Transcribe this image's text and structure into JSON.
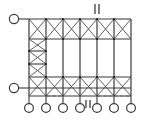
{
  "diagram": {
    "type": "structural-frame-elevation",
    "canvas": {
      "width": 160,
      "height": 123
    },
    "colors": {
      "line": "#3a3a3a",
      "line_light": "#6d6d6d",
      "background": "#ffffff",
      "node": "#1d1d1d"
    },
    "geometry": {
      "columns_x": [
        29,
        46,
        63,
        80,
        97,
        114,
        131
      ],
      "column_count": 7,
      "top_chord_y": 19,
      "top_band_bottom_y": 39,
      "bottom_band_top_y": 77,
      "bottom_chord_y": 96,
      "base_y": 96,
      "support_circle_y": 108,
      "left_pin_top_y": 19,
      "left_pin_bottom_y": 88,
      "left_pin_x": 14,
      "left_bay_strut_ys": [
        29,
        39,
        49,
        58,
        68,
        77
      ],
      "mid_rail_ys": [
        39,
        77
      ]
    },
    "bracing": {
      "top_band_panels": 6,
      "bottom_band_panels": 6,
      "left_bay_panels": 6,
      "pattern": "x-cross"
    },
    "supports": {
      "base_support_count": 7,
      "base_support_label": "pin-support",
      "left_support_count": 2,
      "left_support_label": "pin-support"
    },
    "annotations": [
      {
        "name": "top-dimension-mark",
        "glyph": "||",
        "x": 97,
        "y": 8
      },
      {
        "name": "bottom-dimension-mark",
        "glyph": "||",
        "x": 97,
        "y": 104
      }
    ],
    "dashes": {
      "top_dash_segments": [
        [
          46,
          19,
          63,
          19
        ],
        [
          114,
          19,
          131,
          19
        ]
      ],
      "bottom_dash_segments": [
        [
          46,
          96,
          63,
          96
        ],
        [
          97,
          96,
          131,
          96
        ]
      ]
    }
  }
}
